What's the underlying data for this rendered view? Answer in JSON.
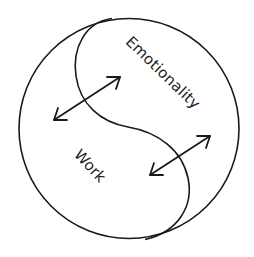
{
  "diagram": {
    "type": "yin-yang interaction diagram",
    "labels": {
      "upper_region": "Emotionality",
      "lower_region": "Work"
    },
    "arrows": [
      {
        "name": "upper-left-bidirectional-arrow",
        "from": [
          53,
          121
        ],
        "to": [
          121,
          76
        ],
        "bidirectional": true
      },
      {
        "name": "lower-right-bidirectional-arrow",
        "from": [
          149,
          176
        ],
        "to": [
          211,
          135
        ],
        "bidirectional": true
      }
    ],
    "outer_circle": {
      "cx": 129,
      "cy": 128.5,
      "r": 110
    },
    "colors": {
      "stroke": "#1a1a1a",
      "background": "#ffffff",
      "text": "#1e1e1e"
    }
  }
}
